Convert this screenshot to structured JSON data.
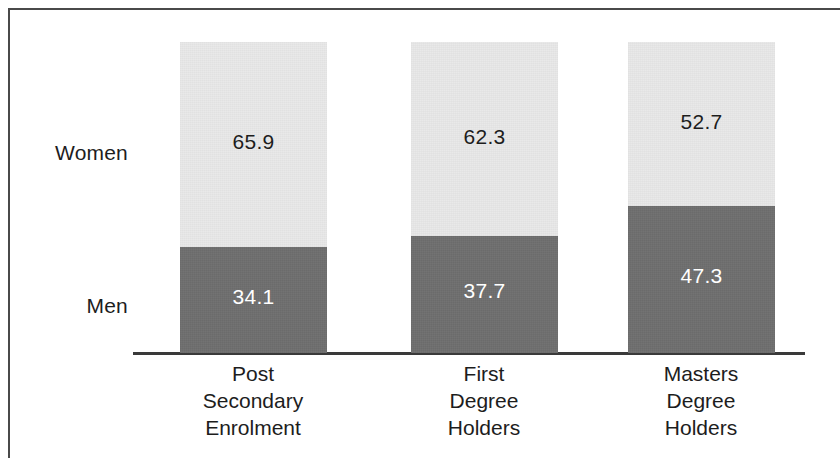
{
  "figure": {
    "background_color": "#ffffff",
    "frame_color": "#4a4a4a",
    "axis_color": "#3a3a3a"
  },
  "legend": {
    "women_label": "Women",
    "men_label": "Men"
  },
  "bars": [
    {
      "category_lines": [
        "Post",
        "Secondary",
        "Enrolment"
      ],
      "women_value": "65.9",
      "men_value": "34.1"
    },
    {
      "category_lines": [
        "First",
        "Degree",
        "Holders"
      ],
      "women_value": "62.3",
      "men_value": "37.7"
    },
    {
      "category_lines": [
        "Masters",
        "Degree",
        "Holders"
      ],
      "women_value": "52.7",
      "men_value": "47.3"
    }
  ],
  "chart_data": {
    "type": "bar",
    "subtype": "stacked-100-percent",
    "orientation": "vertical",
    "title": "",
    "subtitle": "",
    "xlabel": "",
    "ylabel": "",
    "ylim": [
      0,
      100
    ],
    "grid": false,
    "legend_position": "left-inline",
    "categories": [
      "Post Secondary Enrolment",
      "First Degree Holders",
      "Masters Degree Holders"
    ],
    "category_label_lines": [
      [
        "Post",
        "Secondary",
        "Enrolment"
      ],
      [
        "First",
        "Degree",
        "Holders"
      ],
      [
        "Masters",
        "Degree",
        "Holders"
      ]
    ],
    "series": [
      {
        "name": "Women",
        "values": [
          65.9,
          62.3,
          52.7
        ],
        "color": "#e9e9e9",
        "label_color": "#1d1d1d",
        "stack_position": "top"
      },
      {
        "name": "Men",
        "values": [
          34.1,
          37.7,
          47.3
        ],
        "color": "#6f6f6f",
        "label_color": "#ffffff",
        "stack_position": "bottom"
      }
    ],
    "data_labels": [
      {
        "category": "Post Secondary Enrolment",
        "Women": "65.9",
        "Men": "34.1"
      },
      {
        "category": "First Degree Holders",
        "Women": "62.3",
        "Men": "37.7"
      },
      {
        "category": "Masters Degree Holders",
        "Women": "52.7",
        "Men": "47.3"
      }
    ]
  }
}
